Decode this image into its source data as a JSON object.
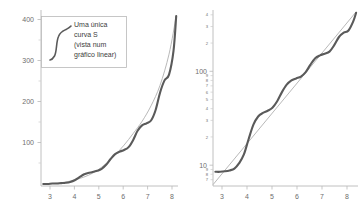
{
  "figure": {
    "background_color": "#ffffff",
    "panels": [
      "linear",
      "logarithmic"
    ]
  },
  "legend": {
    "icon_name": "s-curve-icon",
    "lines": [
      "Uma única",
      "curva S",
      "(vista num",
      "gráfico linear)"
    ],
    "full_text": "Uma única curva S (vista num gráfico linear)",
    "border_color": "#b9b9b9",
    "text_color": "#3d3d3d"
  },
  "colors": {
    "s_curve": "#5a5a5a",
    "reference_curve": "#b0b0b0",
    "axis": "#b9b9b9",
    "tick_text": "#6e6e6e"
  },
  "chart_data": [
    {
      "type": "line",
      "title": "Uma única curva S (vista num gráfico linear)",
      "scale": "linear",
      "xlabel": "",
      "ylabel": "",
      "xlim": [
        2.6,
        8.7
      ],
      "ylim": [
        0,
        430
      ],
      "grid": false,
      "legend_position": "top-left",
      "xticks": [
        3,
        4,
        5,
        6,
        7,
        8
      ],
      "yticks": [
        100,
        200,
        300,
        400
      ],
      "series": [
        {
          "name": "curva S (composta)",
          "color": "#5a5a5a",
          "x": [
            2.7,
            2.9,
            3.1,
            3.3,
            3.5,
            3.7,
            3.9,
            4.1,
            4.3,
            4.5,
            4.7,
            4.9,
            5.1,
            5.3,
            5.5,
            5.7,
            5.9,
            6.1,
            6.3,
            6.5,
            6.7,
            6.9,
            7.1,
            7.3,
            7.5,
            7.7,
            7.9,
            8.1,
            8.3,
            8.5,
            8.62
          ],
          "y": [
            5,
            5,
            6,
            6,
            7,
            8,
            10,
            14,
            21,
            28,
            32,
            34,
            37,
            42,
            52,
            66,
            78,
            84,
            88,
            95,
            112,
            135,
            148,
            153,
            160,
            185,
            228,
            258,
            272,
            330,
            415
          ]
        },
        {
          "name": "exponencial de referência",
          "color": "#b0b0b0",
          "x": [
            2.7,
            3.1,
            3.5,
            3.9,
            4.3,
            4.7,
            5.1,
            5.5,
            5.9,
            6.3,
            6.7,
            7.1,
            7.5,
            7.9,
            8.3,
            8.62
          ],
          "y": [
            4,
            6,
            8,
            12,
            18,
            26,
            38,
            55,
            76,
            100,
            128,
            158,
            196,
            246,
            322,
            415
          ]
        }
      ]
    },
    {
      "type": "line",
      "title": "",
      "scale": "log",
      "xlabel": "",
      "ylabel": "",
      "xlim": [
        2.6,
        8.7
      ],
      "ylim": [
        6,
        450
      ],
      "grid": false,
      "legend_position": "none",
      "xticks": [
        3,
        4,
        5,
        6,
        7,
        8
      ],
      "yticks_major": [
        10,
        100
      ],
      "yticks_minor_upper": [
        2,
        3,
        4
      ],
      "yticks_minor_mid": [
        2,
        3,
        4,
        5,
        6,
        7,
        8,
        9
      ],
      "yticks_minor_lower": [
        7,
        8,
        9
      ],
      "series": [
        {
          "name": "curva S (composta)",
          "color": "#5a5a5a",
          "x": [
            2.7,
            2.9,
            3.1,
            3.3,
            3.5,
            3.7,
            3.9,
            4.1,
            4.3,
            4.5,
            4.7,
            4.9,
            5.1,
            5.3,
            5.5,
            5.7,
            5.9,
            6.1,
            6.3,
            6.5,
            6.7,
            6.9,
            7.1,
            7.3,
            7.5,
            7.7,
            7.9,
            8.1,
            8.3,
            8.5,
            8.62
          ],
          "y": [
            8.5,
            8.5,
            8.6,
            8.8,
            9.2,
            10.5,
            13,
            19,
            27,
            33,
            36,
            38,
            41,
            48,
            60,
            72,
            80,
            84,
            88,
            98,
            118,
            138,
            148,
            154,
            162,
            190,
            232,
            258,
            272,
            340,
            420
          ]
        },
        {
          "name": "exponencial de referência",
          "color": "#b0b0b0",
          "x": [
            2.6,
            8.62
          ],
          "y": [
            6.2,
            430
          ]
        }
      ]
    }
  ]
}
